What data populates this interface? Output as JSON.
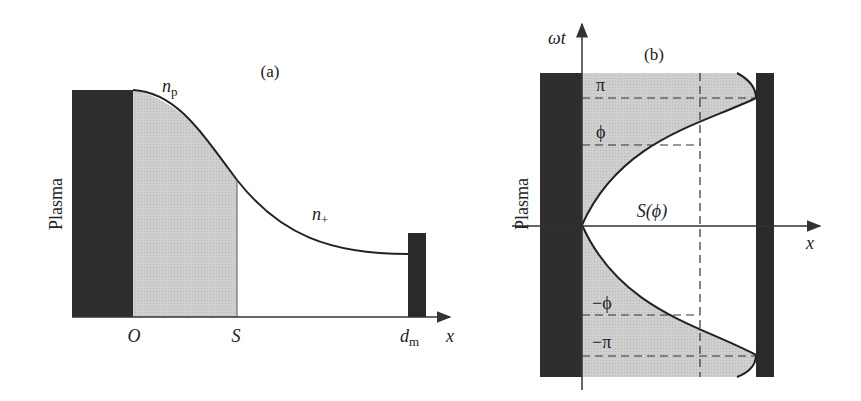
{
  "panel_a": {
    "title": "(a)",
    "side_label": "Plasma",
    "curve_label_top": "n",
    "curve_label_top_sub": "p",
    "curve_label_mid": "n",
    "curve_label_mid_sub": "+",
    "x_ticks": {
      "origin": "O",
      "sheath": "S",
      "electrode": "d",
      "electrode_sub": "m"
    },
    "x_axis_label": "x",
    "colors": {
      "plasma_block": "#2e2e2e",
      "sheath_fill": "#c9c9c9",
      "electrode": "#2a2a2a",
      "curve": "#222222"
    }
  },
  "panel_b": {
    "title": "(b)",
    "side_label": "Plasma",
    "y_axis_label": "ωt",
    "x_axis_label": "x",
    "labels": {
      "pi": "π",
      "phi": "ϕ",
      "neg_phi": "−ϕ",
      "neg_pi": "−π",
      "s_of_phi": "S(ϕ)"
    },
    "colors": {
      "plasma_block": "#2e2e2e",
      "sheath_fill": "#c9c9c9",
      "electrode": "#2a2a2a",
      "curve": "#222222",
      "dashed": "#333333"
    }
  }
}
